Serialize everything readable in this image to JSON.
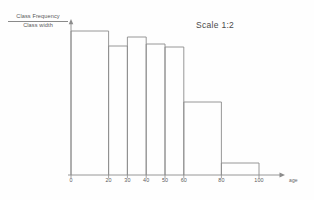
{
  "figure": {
    "scale_note": "Scale 1:2",
    "y_axis_label_numerator": "Class Frequency",
    "y_axis_label_denominator": "Class width",
    "x_axis_title": "age"
  },
  "colors": {
    "ink": "#8c8c8c",
    "ink_dark": "#6e6e6e",
    "text": "#5a5a5a",
    "paper": "#fefefe"
  },
  "chart_data": {
    "type": "bar",
    "title": "",
    "subtitle": "Scale 1:2",
    "xlabel": "age",
    "ylabel": "Class Frequency / Class width",
    "grid": false,
    "legend": null,
    "xlim": [
      0,
      110
    ],
    "ylim": [
      0,
      160
    ],
    "x_tick_labels": [
      "0",
      "20",
      "30",
      "40",
      "50",
      "60",
      "80",
      "100"
    ],
    "x_tick_values": [
      0,
      20,
      30,
      40,
      50,
      60,
      80,
      100
    ],
    "bin_edges": [
      0,
      20,
      30,
      40,
      50,
      60,
      80,
      100
    ],
    "categories": [
      "0-20",
      "20-30",
      "30-40",
      "40-50",
      "50-60",
      "60-80",
      "80-100"
    ],
    "values": [
      144,
      129,
      138,
      131,
      128,
      73,
      12
    ],
    "bars": [
      {
        "label": "0-20",
        "x0": 0,
        "x1": 20,
        "height": 144
      },
      {
        "label": "20-30",
        "x0": 20,
        "x1": 30,
        "height": 129
      },
      {
        "label": "30-40",
        "x0": 30,
        "x1": 40,
        "height": 138
      },
      {
        "label": "40-50",
        "x0": 40,
        "x1": 50,
        "height": 131
      },
      {
        "label": "50-60",
        "x0": 50,
        "x1": 60,
        "height": 128
      },
      {
        "label": "60-80",
        "x0": 60,
        "x1": 80,
        "height": 73
      },
      {
        "label": "80-100",
        "x0": 80,
        "x1": 100,
        "height": 12
      }
    ]
  }
}
